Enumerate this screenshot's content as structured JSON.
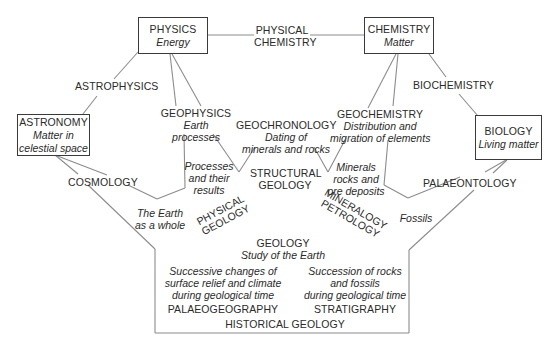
{
  "boxes": {
    "physics": {
      "title": "PHYSICS",
      "subtitle": "Energy"
    },
    "chemistry": {
      "title": "CHEMISTRY",
      "subtitle": "Matter"
    },
    "astronomy": {
      "title": "ASTRONOMY",
      "subtitle_line1": "Matter in",
      "subtitle_line2": "celestial space"
    },
    "biology": {
      "title": "BIOLOGY",
      "subtitle": "Living matter"
    }
  },
  "links": {
    "physical_chemistry": {
      "line1": "PHYSICAL",
      "line2": "CHEMISTRY"
    },
    "astrophysics": "ASTROPHYSICS",
    "biochemistry": "BIOCHEMISTRY",
    "cosmology": "COSMOLOGY",
    "palaeontology": "PALAEONTOLOGY"
  },
  "branches": {
    "geophysics": {
      "title": "GEOPHYSICS",
      "line1": "Earth",
      "line2": "processes"
    },
    "geochronology": {
      "title": "GEOCHRONOLOGY",
      "line1": "Dating of",
      "line2": "minerals and rocks"
    },
    "geochemistry": {
      "title": "GEOCHEMISTRY",
      "line1": "Distribution and",
      "line2": "migration of elements"
    },
    "structural_geology": {
      "line1": "STRUCTURAL",
      "line2": "GEOLOGY"
    },
    "processes": {
      "line1": "Processes",
      "line2": "and their",
      "line3": "results"
    },
    "minerals": {
      "line1": "Minerals",
      "line2": "rocks and",
      "line3": "ore deposits"
    },
    "earth_whole": {
      "line1": "The Earth",
      "line2": "as a whole"
    },
    "fossils": "Fossils",
    "physical_geology": {
      "line1": "PHYSICAL",
      "line2": "GEOLOGY"
    },
    "mineralogy_petrology": {
      "line1": "MINERALOGY",
      "line2": "PETROLOGY"
    }
  },
  "center": {
    "title": "GEOLOGY",
    "subtitle": "Study of the Earth"
  },
  "historical": {
    "palaeogeography": {
      "line1": "Successive changes of",
      "line2": "surface relief and climate",
      "line3": "during geological time",
      "title": "PALAEOGEOGRAPHY"
    },
    "stratigraphy": {
      "line1": "Succession of rocks",
      "line2": "and fossils",
      "line3": "during geological time",
      "title": "STRATIGRAPHY"
    },
    "title": "HISTORICAL GEOLOGY"
  },
  "colors": {
    "line": "#8a8a8a",
    "box_border": "#3a3a3a",
    "text": "#2a2a2a"
  }
}
